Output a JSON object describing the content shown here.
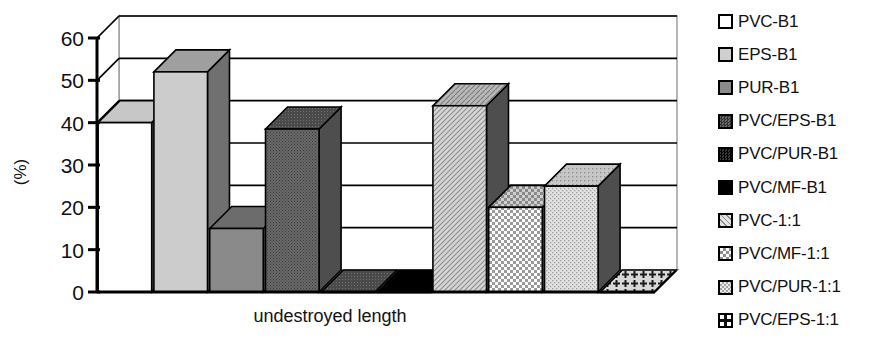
{
  "chart_data": {
    "type": "bar",
    "title": "",
    "xlabel": "undestroyed length",
    "ylabel": "(%)",
    "ylim": [
      0,
      60
    ],
    "yticks": [
      0,
      10,
      20,
      30,
      40,
      50,
      60
    ],
    "ytick_labels": [
      "0",
      "10",
      "20",
      "30",
      "40",
      "50",
      "60"
    ],
    "grid": true,
    "legend_position": "right",
    "style": "3d-bar",
    "categories": [
      "PVC-B1",
      "EPS-B1",
      "PUR-B1",
      "PVC/EPS-B1",
      "PVC/PUR-B1",
      "PVC/MF-B1",
      "PVC-1:1",
      "PVC/MF-1:1",
      "PVC/PUR-1:1",
      "PVC/EPS-1:1"
    ],
    "values": [
      40,
      52,
      15,
      38.5,
      0,
      0,
      44,
      20,
      25,
      0
    ],
    "series": [
      {
        "name": "undestroyed length",
        "values": [
          40,
          52,
          15,
          38.5,
          0,
          0,
          44,
          20,
          25,
          0
        ]
      }
    ],
    "bars": [
      {
        "label": "PVC-B1",
        "value": 40,
        "fill": "#ffffff",
        "pattern": "solid"
      },
      {
        "label": "EPS-B1",
        "value": 52,
        "fill": "#cccccc",
        "pattern": "solid"
      },
      {
        "label": "PUR-B1",
        "value": 15,
        "fill": "#8a8a8a",
        "pattern": "solid"
      },
      {
        "label": "PVC/EPS-B1",
        "value": 38.5,
        "fill": "#5a5a5a",
        "pattern": "fine-dots"
      },
      {
        "label": "PVC/PUR-B1",
        "value": 0,
        "fill": "#222222",
        "pattern": "dark-dots"
      },
      {
        "label": "PVC/MF-B1",
        "value": 0,
        "fill": "#000000",
        "pattern": "solid"
      },
      {
        "label": "PVC-1:1",
        "value": 44,
        "fill": "#c9c9c9",
        "pattern": "diagonal"
      },
      {
        "label": "PVC/MF-1:1",
        "value": 20,
        "fill": "#dcdcdc",
        "pattern": "checker"
      },
      {
        "label": "PVC/PUR-1:1",
        "value": 25,
        "fill": "#d2d2d2",
        "pattern": "stipple"
      },
      {
        "label": "PVC/EPS-1:1",
        "value": 0,
        "fill": "#ffffff",
        "pattern": "cross-plus"
      }
    ]
  },
  "legend": {
    "items": [
      {
        "label": "PVC-B1",
        "swatch": "swatch-white"
      },
      {
        "label": "EPS-B1",
        "swatch": "swatch-light-gray"
      },
      {
        "label": "PUR-B1",
        "swatch": "swatch-mid-gray"
      },
      {
        "label": "PVC/EPS-B1",
        "swatch": "swatch-dark-dots"
      },
      {
        "label": "PVC/PUR-B1",
        "swatch": "swatch-very-dark"
      },
      {
        "label": "PVC/MF-B1",
        "swatch": "swatch-black"
      },
      {
        "label": "PVC-1:1",
        "swatch": "swatch-diagonal"
      },
      {
        "label": "PVC/MF-1:1",
        "swatch": "swatch-checker"
      },
      {
        "label": "PVC/PUR-1:1",
        "swatch": "swatch-stipple"
      },
      {
        "label": "PVC/EPS-1:1",
        "swatch": "swatch-cross-plus"
      }
    ]
  }
}
